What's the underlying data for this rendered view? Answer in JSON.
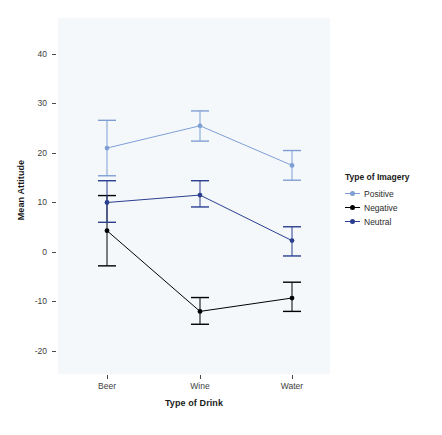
{
  "chart_data": {
    "type": "line",
    "title": "",
    "xlabel": "Type of Drink",
    "ylabel": "Mean Attitude",
    "categories": [
      "Beer",
      "Wine",
      "Water"
    ],
    "xtick_labels": [
      "Beer",
      "Wine",
      "Water"
    ],
    "ytick_labels": [
      "40",
      "30",
      "20",
      "10",
      "0",
      "-10",
      "-20"
    ],
    "ytick_values": [
      40,
      30,
      20,
      10,
      0,
      -10,
      -20
    ],
    "ylim": [
      -25,
      45
    ],
    "grid": false,
    "legend_position": "right",
    "legend_title": "Type of Imagery",
    "series": [
      {
        "name": "Positive",
        "color": "#7f9fd4",
        "values": [
          21.0,
          25.5,
          17.5
        ],
        "err_low": [
          15.4,
          22.4,
          14.5
        ],
        "err_high": [
          26.6,
          28.5,
          20.5
        ]
      },
      {
        "name": "Negative",
        "color": "#000000",
        "values": [
          4.3,
          -12.0,
          -9.3
        ],
        "err_low": [
          -2.8,
          -14.6,
          -12.0
        ],
        "err_high": [
          11.4,
          -9.2,
          -6.1
        ]
      },
      {
        "name": "Neutral",
        "color": "#2b3f8f",
        "values": [
          10.0,
          11.5,
          2.3
        ],
        "err_low": [
          6.0,
          9.1,
          -0.8
        ],
        "err_high": [
          14.4,
          14.4,
          5.1
        ]
      }
    ]
  },
  "panel": {
    "background_color": "#f4f8fb"
  },
  "axes": {
    "tick_color": "#4a4a4a",
    "label_color": "#1a1a1a"
  }
}
